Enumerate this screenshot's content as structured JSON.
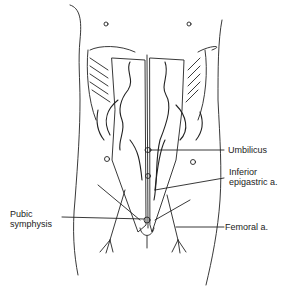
{
  "figure": {
    "labels": {
      "umbilicus": "Umbilicus",
      "inferior_epigastric_line1": "Inferior",
      "inferior_epigastric_line2": "epigastric a.",
      "pubic_symphysis_line1": "Pubic",
      "pubic_symphysis_line2": "symphysis",
      "femoral": "Femoral a."
    },
    "colors": {
      "line": "#222222",
      "background": "#ffffff"
    }
  }
}
